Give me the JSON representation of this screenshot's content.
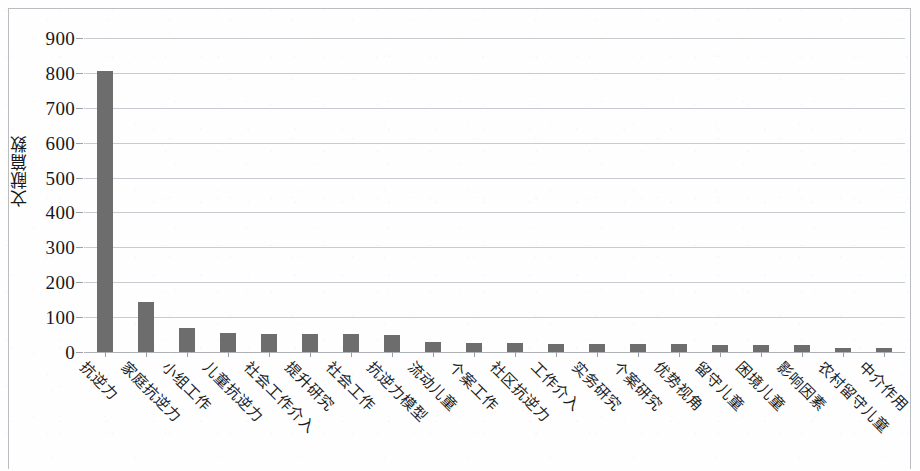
{
  "chart_data": {
    "type": "bar",
    "title": "",
    "xlabel": "",
    "ylabel": "文献篇数",
    "ylim": [
      0,
      900
    ],
    "ytick_step": 100,
    "yticks": [
      "900",
      "800",
      "700",
      "600",
      "500",
      "400",
      "300",
      "200",
      "100",
      "0"
    ],
    "grid": true,
    "legend": "none",
    "bar_color": "#6d6d6d",
    "gridline_color": "#c8ccd0",
    "categories": [
      "抗逆力",
      "家庭抗逆力",
      "小组工作",
      "儿童抗逆力",
      "社会工作介入",
      "提升研究",
      "社会工作",
      "抗逆力模型",
      "流动儿童",
      "个案工作",
      "社区抗逆力",
      "工作介入",
      "实务研究",
      "个案研究",
      "优势视角",
      "留守儿童",
      "困境儿童",
      "影响因素",
      "农村留守儿童",
      "中介作用"
    ],
    "values": [
      806,
      143,
      70,
      55,
      53,
      52,
      52,
      48,
      30,
      27,
      26,
      24,
      23,
      23,
      22,
      21,
      21,
      20,
      12,
      11
    ]
  }
}
